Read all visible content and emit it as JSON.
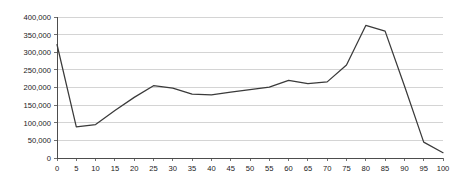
{
  "chart_data": {
    "type": "line",
    "title": "",
    "subtitle": "",
    "xlabel": "",
    "ylabel": "",
    "x": [
      0,
      5,
      10,
      15,
      20,
      25,
      30,
      35,
      40,
      45,
      50,
      55,
      60,
      65,
      70,
      75,
      80,
      85,
      90,
      95,
      100
    ],
    "values": [
      322000,
      88000,
      95000,
      135000,
      172000,
      205000,
      198000,
      181000,
      179000,
      187000,
      194000,
      201000,
      220000,
      211000,
      216000,
      264000,
      376000,
      360000,
      205000,
      45000,
      15000
    ],
    "series": [
      {
        "name": "series-1",
        "values": [
          322000,
          88000,
          95000,
          135000,
          172000,
          205000,
          198000,
          181000,
          179000,
          187000,
          194000,
          201000,
          220000,
          211000,
          216000,
          264000,
          376000,
          360000,
          205000,
          45000,
          15000
        ]
      }
    ],
    "xlim": [
      0,
      100
    ],
    "ylim": [
      0,
      400000
    ],
    "xtick_labels": [
      "0",
      "5",
      "10",
      "15",
      "20",
      "25",
      "30",
      "35",
      "40",
      "45",
      "50",
      "55",
      "60",
      "65",
      "70",
      "75",
      "80",
      "85",
      "90",
      "95",
      "100"
    ],
    "ytick_values": [
      0,
      50000,
      100000,
      150000,
      200000,
      250000,
      300000,
      350000,
      400000
    ],
    "ytick_labels": [
      "0",
      "50,000",
      "100,000",
      "150,000",
      "200,000",
      "250,000",
      "300,000",
      "350,000",
      "400,000"
    ],
    "grid": true,
    "grid_axis": "y",
    "legend": false,
    "legend_position": "none",
    "line_color": "#3a3a3a",
    "grid_color": "#c9c9c9",
    "axis_color": "#4d4d4d",
    "background_color": "#ffffff",
    "annotations": []
  }
}
